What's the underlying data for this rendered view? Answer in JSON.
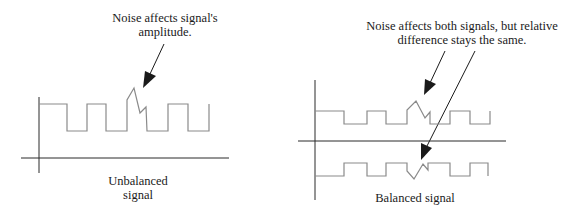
{
  "left_panel": {
    "annotation_line1": "Noise affects signal's",
    "annotation_line2": "amplitude.",
    "caption_line1": "Unbalanced",
    "caption_line2": "signal"
  },
  "right_panel": {
    "annotation_line1": "Noise affects both signals, but relative",
    "annotation_line2": "difference stays the same.",
    "caption": "Balanced signal"
  },
  "colors": {
    "axis": "#2a2a2a",
    "signal": "#8a8a8a",
    "arrow": "#1a1a1a",
    "text": "#1a1a1a"
  }
}
